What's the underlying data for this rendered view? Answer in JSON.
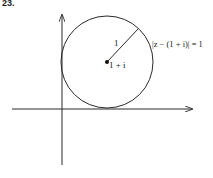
{
  "figure": {
    "problem_number": "23.",
    "colors": {
      "stroke": "#2a2a2a",
      "background": "#ffffff"
    },
    "axes": {
      "x_axis": {
        "y": 109,
        "x_start": 12,
        "x_end": 192
      },
      "y_axis": {
        "x": 62,
        "y_start": 165,
        "y_end": 15
      }
    },
    "circle": {
      "cx": 107,
      "cy": 62,
      "r": 46
    },
    "radius_line": {
      "x1": 107,
      "y1": 62,
      "x2": 138,
      "y2": 29
    },
    "labels": {
      "radius": "1",
      "center": "1 + i",
      "equation": "|z − (1 + i)| = 1"
    }
  }
}
